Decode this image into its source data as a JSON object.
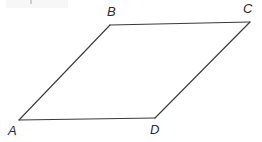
{
  "figure": {
    "kind": "geometry-diagram",
    "shape": "parallelogram",
    "name": "ABCD",
    "background_color": "#ffffff",
    "stroke_color": "#3a3a3a",
    "stroke_width": 1,
    "label_color": "#2b2b2b",
    "canvas": {
      "width": 262,
      "height": 142
    },
    "vertices": [
      {
        "id": "A",
        "label": "A",
        "x": 19,
        "y": 120,
        "label_x": 8,
        "label_y": 124
      },
      {
        "id": "B",
        "label": "B",
        "x": 110,
        "y": 25,
        "label_x": 107,
        "label_y": 5
      },
      {
        "id": "C",
        "label": "C",
        "x": 250,
        "y": 22,
        "label_x": 243,
        "label_y": 2
      },
      {
        "id": "D",
        "label": "D",
        "x": 155,
        "y": 118,
        "label_x": 150,
        "label_y": 123
      }
    ],
    "edges": [
      {
        "id": "AB",
        "from": "A",
        "to": "B"
      },
      {
        "id": "BC",
        "from": "B",
        "to": "C"
      },
      {
        "id": "CD",
        "from": "C",
        "to": "D"
      },
      {
        "id": "DA",
        "from": "D",
        "to": "A"
      }
    ],
    "path": "M 19 120 L 110 25 L 250 22 L 155 118 Z",
    "labels": {
      "A": "A",
      "B": "B",
      "C": "C",
      "D": "D"
    }
  }
}
